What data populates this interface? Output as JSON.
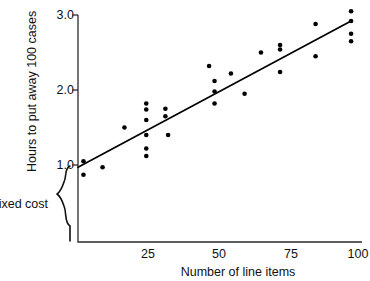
{
  "chart_data": {
    "type": "scatter",
    "title": "",
    "subtitle": "",
    "xlabel": "Number of line items",
    "ylabel": "Hours to put away 100 cases",
    "xlim": [
      0,
      104
    ],
    "ylim": [
      0.55,
      3.15
    ],
    "xticks": [
      25,
      50,
      75,
      100
    ],
    "xtick_labels": [
      "25",
      "50",
      "75",
      "100"
    ],
    "yticks": [
      1.0,
      2.0,
      3.0
    ],
    "ytick_labels": [
      "1.0",
      "2.0",
      "3.0"
    ],
    "grid": false,
    "legend": false,
    "annotations": [
      {
        "name": "fixed-cost-brace",
        "label": "Fixed cost",
        "y_from": 0.0,
        "y_to": 1.0,
        "description": "Curly brace on left axis spanning from origin up to the y-intercept of the regression line"
      }
    ],
    "series": [
      {
        "name": "observations",
        "marker": "filled-circle",
        "color": "#000000",
        "points": [
          [
            2,
            1.05
          ],
          [
            2,
            0.87
          ],
          [
            9,
            0.97
          ],
          [
            17,
            1.5
          ],
          [
            25,
            1.82
          ],
          [
            25,
            1.74
          ],
          [
            25,
            1.6
          ],
          [
            25,
            1.4
          ],
          [
            25,
            1.22
          ],
          [
            25,
            1.12
          ],
          [
            32,
            1.75
          ],
          [
            32,
            1.65
          ],
          [
            33,
            1.4
          ],
          [
            48,
            2.32
          ],
          [
            50,
            2.12
          ],
          [
            50,
            1.98
          ],
          [
            50,
            1.82
          ],
          [
            56,
            2.22
          ],
          [
            61,
            1.95
          ],
          [
            67,
            2.5
          ],
          [
            74,
            2.6
          ],
          [
            74,
            2.54
          ],
          [
            74,
            2.24
          ],
          [
            87,
            2.88
          ],
          [
            87,
            2.45
          ],
          [
            100,
            3.05
          ],
          [
            100,
            2.92
          ],
          [
            100,
            2.75
          ],
          [
            100,
            2.65
          ]
        ]
      }
    ],
    "trendline": {
      "name": "regression-line",
      "type": "linear",
      "color": "#000000",
      "x_start": 0,
      "y_start": 0.97,
      "x_end": 100,
      "y_end": 2.92,
      "intercept": 0.97,
      "slope": 0.0195
    }
  }
}
